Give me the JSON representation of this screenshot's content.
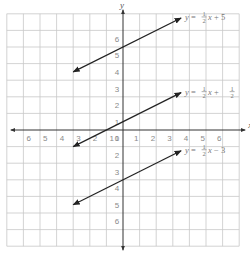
{
  "chart_data": {
    "type": "line",
    "title": "",
    "xlabel": "x",
    "ylabel": "y",
    "xlim": [
      -7,
      7
    ],
    "ylim": [
      -7,
      7
    ],
    "grid": true,
    "x_ticks": [
      "6",
      "5",
      "4",
      "3",
      "2",
      "1",
      "0",
      "1",
      "2",
      "3",
      "4",
      "5",
      "6"
    ],
    "y_ticks_positive": [
      "1",
      "2",
      "3",
      "4",
      "5",
      "6"
    ],
    "y_ticks_negative": [
      "1",
      "2",
      "3",
      "4",
      "5",
      "6"
    ],
    "series": [
      {
        "name": "y = 1/2x + 5",
        "slope": 0.5,
        "intercept": 5,
        "x_range": [
          -3,
          3.5
        ],
        "label": {
          "prefix": "y = ",
          "num": "1",
          "den": "2",
          "suffix": "x + 5",
          "const_num": null,
          "const_den": null
        }
      },
      {
        "name": "y = 1/2x + 1/2",
        "slope": 0.5,
        "intercept": 0.5,
        "x_range": [
          -3,
          3.5
        ],
        "label": {
          "prefix": "y = ",
          "num": "1",
          "den": "2",
          "suffix": "x + ",
          "const_num": "1",
          "const_den": "2"
        }
      },
      {
        "name": "y = 1/2x − 3",
        "slope": 0.5,
        "intercept": -3,
        "x_range": [
          -3,
          3.5
        ],
        "label": {
          "prefix": "y = ",
          "num": "1",
          "den": "2",
          "suffix": "x − 3",
          "const_num": null,
          "const_den": null
        }
      }
    ],
    "line_color": "#222222",
    "grid_color": "#c8c8c8",
    "axis_color": "#333333"
  }
}
